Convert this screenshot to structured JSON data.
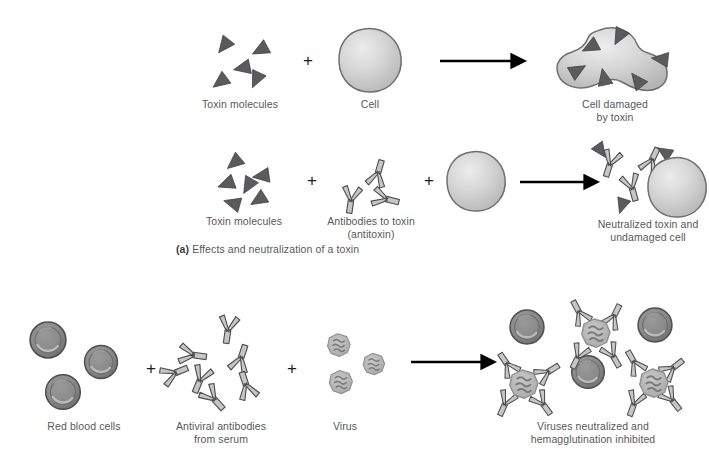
{
  "figure": {
    "background_color": "#ffffff",
    "text_color": "#58585a",
    "toxin_color": "#5b5b5d",
    "cell_fill": "#c9c9c9",
    "cell_highlight": "#e8e8e8",
    "antibody_fill": "#c6c6c6",
    "antibody_stroke": "#4d4d4f",
    "rbc_fill": "#8a8a8a",
    "rbc_rim": "#5e5e5e",
    "virus_fill": "#b4b4b4",
    "virus_detail": "#7a7a7a",
    "arrow_color": "#000000",
    "plus_color": "#1a1a1a"
  },
  "panel_a": {
    "caption_tag": "(a)",
    "caption_text": " Effects and neutralization of a toxin",
    "row1": {
      "item1_label": "Toxin molecules",
      "operator1": "+",
      "item2_label": "Cell",
      "arrow": "→",
      "result_label": "Cell damaged\nby toxin",
      "toxin_count": 5,
      "attached_toxin_count": 6
    },
    "row2": {
      "item1_label": "Toxin molecules",
      "operator1": "+",
      "item2_label": "Antibodies to toxin\n(antitoxin)",
      "operator2": "+",
      "item3_label": "",
      "arrow": "→",
      "result_label": "Neutralized toxin and\nundamaged cell",
      "toxin_count": 5,
      "antibody_count": 3,
      "result_complex_count": 3
    }
  },
  "panel_b": {
    "item1_label": "Red blood cells",
    "operator1": "+",
    "item2_label": "Antiviral antibodies\nfrom serum",
    "operator2": "+",
    "item3_label": "Virus",
    "arrow": "→",
    "result_label": "Viruses neutralized and\nhemagglutination inhibited",
    "rbc_count": 3,
    "antibody_count": 7,
    "virus_count": 3,
    "result_rbc_count": 3,
    "result_virus_complex_count": 3
  }
}
